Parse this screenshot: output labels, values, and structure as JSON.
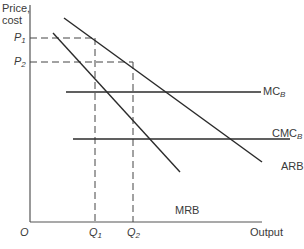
{
  "diagram": {
    "y_axis_label_line1": "Price,",
    "y_axis_label_line2": "cost",
    "x_axis_label": "Output",
    "origin_label": "O",
    "price_levels": [
      {
        "label": "P",
        "sub": "1"
      },
      {
        "label": "P",
        "sub": "2"
      }
    ],
    "quantity_levels": [
      {
        "label": "Q",
        "sub": "1"
      },
      {
        "label": "Q",
        "sub": "2"
      }
    ],
    "curves": {
      "mc": {
        "label": "MC",
        "sub": "B"
      },
      "cmc": {
        "label": "CMC",
        "sub": "B"
      },
      "arb": {
        "label": "ARB"
      },
      "mrb": {
        "label": "MRB"
      }
    },
    "line_color": "#2b2b2b",
    "axis_color": "#555555"
  }
}
